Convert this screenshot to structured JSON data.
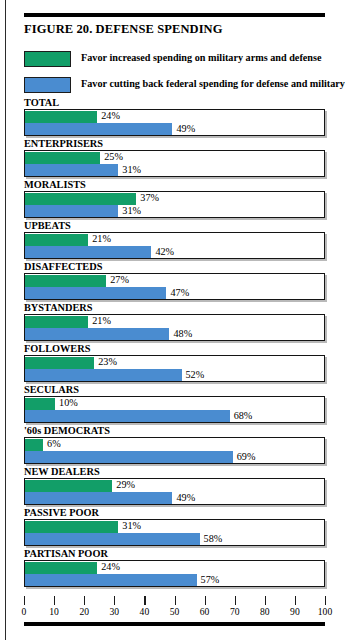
{
  "figure": {
    "title": "FIGURE 20. DEFENSE SPENDING"
  },
  "legend": [
    {
      "label": "Favor increased spending on military arms and defense",
      "color": "#129e68",
      "key": "green"
    },
    {
      "label": "Favor cutting back federal spending for defense and military",
      "color": "#4a8cd0",
      "key": "blue"
    }
  ],
  "axis": {
    "min": 0,
    "max": 100,
    "step": 10,
    "ticks": [
      "0",
      "10",
      "20",
      "30",
      "40",
      "50",
      "60",
      "70",
      "80",
      "90",
      "100"
    ]
  },
  "chart_data": {
    "type": "bar",
    "title": "FIGURE 20. DEFENSE SPENDING",
    "xlabel": "",
    "ylabel": "",
    "xlim": [
      0,
      100
    ],
    "orientation": "horizontal",
    "grid": false,
    "legend_position": "top",
    "categories": [
      "TOTAL",
      "ENTERPRISERS",
      "MORALISTS",
      "UPBEATS",
      "DISAFFECTEDS",
      "BYSTANDERS",
      "FOLLOWERS",
      "SECULARS",
      "'60s DEMOCRATS",
      "NEW DEALERS",
      "PASSIVE POOR",
      "PARTISAN POOR"
    ],
    "series": [
      {
        "name": "Favor increased spending on military arms and defense",
        "color": "#129e68",
        "values": [
          24,
          25,
          37,
          21,
          27,
          21,
          23,
          10,
          6,
          29,
          31,
          24
        ],
        "labels": [
          "24%",
          "25%",
          "37%",
          "21%",
          "27%",
          "21%",
          "23%",
          "10%",
          "6%",
          "29%",
          "31%",
          "24%"
        ]
      },
      {
        "name": "Favor cutting back federal spending for defense and military",
        "color": "#4a8cd0",
        "values": [
          49,
          31,
          31,
          42,
          47,
          48,
          52,
          68,
          69,
          49,
          58,
          57
        ],
        "labels": [
          "49%",
          "31%",
          "31%",
          "42%",
          "47%",
          "48%",
          "52%",
          "68%",
          "69%",
          "49%",
          "58%",
          "57%"
        ]
      }
    ]
  }
}
